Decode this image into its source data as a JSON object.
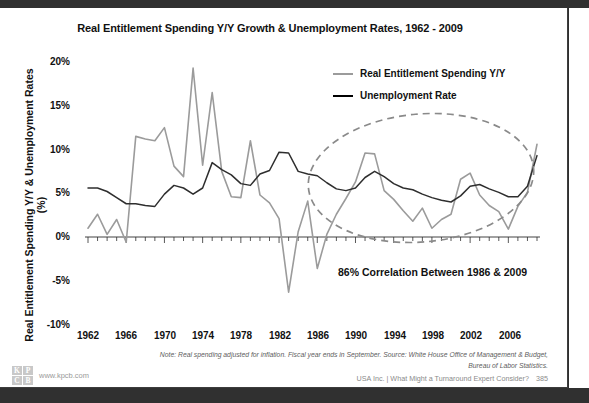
{
  "slide": {
    "title": "Real Entitlement Spending Y/Y Growth & Unemployment Rates, 1962 - 2009",
    "annotation": "86% Correlation Between 1986 & 2009",
    "note": "Note: Real spending adjusted for inflation. Fiscal year ends in September. Source: White House Office of Management & Budget, Bureau of Labor Statistics.",
    "source_line": "USA Inc. | What Might a Turnaround Expert Consider?",
    "page_number": "385",
    "logo": {
      "cell_k": "K",
      "cell_p": "P",
      "cell_c": "C",
      "cell_b": "B",
      "url": "www.kpcb.com"
    }
  },
  "chart_data": {
    "type": "line",
    "title": "Real Entitlement Spending Y/Y Growth & Unemployment Rates, 1962 - 2009",
    "xlabel": "",
    "ylabel": "Real Entitlement Spending Y/Y & Unemployment Rates (%)",
    "ylim": [
      -10,
      20
    ],
    "y_tick_labels": [
      "20%",
      "15%",
      "10%",
      "5%",
      "0%",
      "-5%",
      "-10%"
    ],
    "y_ticks": [
      20,
      15,
      10,
      5,
      0,
      -5,
      -10
    ],
    "xlim": [
      1962,
      2009
    ],
    "x_tick_labels": [
      "1962",
      "1966",
      "1970",
      "1974",
      "1978",
      "1982",
      "1986",
      "1990",
      "1994",
      "1998",
      "2002",
      "2006"
    ],
    "x_ticks": [
      1962,
      1966,
      1970,
      1974,
      1978,
      1982,
      1986,
      1990,
      1994,
      1998,
      2002,
      2006
    ],
    "grid": false,
    "legend_position": "upper-right",
    "x": [
      1962,
      1963,
      1964,
      1965,
      1966,
      1967,
      1968,
      1969,
      1970,
      1971,
      1972,
      1973,
      1974,
      1975,
      1976,
      1977,
      1978,
      1979,
      1980,
      1981,
      1982,
      1983,
      1984,
      1985,
      1986,
      1987,
      1988,
      1989,
      1990,
      1991,
      1992,
      1993,
      1994,
      1995,
      1996,
      1997,
      1998,
      1999,
      2000,
      2001,
      2002,
      2003,
      2004,
      2005,
      2006,
      2007,
      2008,
      2009
    ],
    "series": [
      {
        "name": "Real Entitlement Spending Y/Y",
        "color": "#9b9b9b",
        "values": [
          1.0,
          2.6,
          0.3,
          2.0,
          -0.6,
          11.5,
          11.2,
          11.0,
          12.5,
          8.1,
          6.9,
          19.3,
          8.2,
          16.5,
          7.5,
          4.6,
          4.5,
          11.0,
          4.8,
          3.9,
          2.1,
          -6.3,
          0.6,
          4.1,
          -3.6,
          0.3,
          2.6,
          4.4,
          6.3,
          9.6,
          9.5,
          5.3,
          4.3,
          3.0,
          1.8,
          3.3,
          1.0,
          2.0,
          2.6,
          6.6,
          7.3,
          4.8,
          3.6,
          2.9,
          0.9,
          3.5,
          5.1,
          10.6
        ]
      },
      {
        "name": "Unemployment Rate",
        "color": "#2e2e2e",
        "values": [
          5.6,
          5.6,
          5.2,
          4.5,
          3.8,
          3.8,
          3.6,
          3.5,
          4.9,
          5.9,
          5.6,
          4.9,
          5.6,
          8.5,
          7.7,
          7.1,
          6.1,
          5.9,
          7.2,
          7.6,
          9.7,
          9.6,
          7.5,
          7.2,
          7.0,
          6.2,
          5.5,
          5.3,
          5.6,
          6.8,
          7.5,
          6.9,
          6.1,
          5.6,
          5.4,
          4.9,
          4.5,
          4.2,
          4.0,
          4.7,
          5.8,
          6.0,
          5.5,
          5.1,
          4.6,
          4.6,
          5.8,
          9.3
        ]
      }
    ],
    "annotations": [
      {
        "text": "86% Correlation Between 1986 & 2009",
        "shape": "dashed-ellipse",
        "x_range": [
          1986,
          2009
        ]
      }
    ]
  }
}
